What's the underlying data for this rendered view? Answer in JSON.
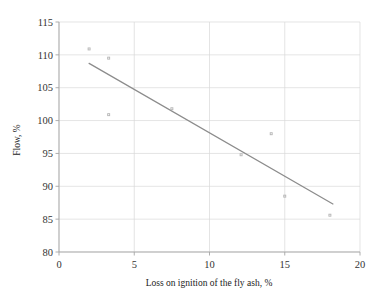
{
  "chart_data": {
    "type": "scatter",
    "title": "",
    "xlabel": "Loss on ignition of the fly ash, %",
    "ylabel": "Flow, %",
    "xlim": [
      0,
      20
    ],
    "ylim": [
      80,
      115
    ],
    "xticks": [
      0,
      5,
      10,
      15,
      20
    ],
    "yticks": [
      80,
      85,
      90,
      95,
      100,
      105,
      110,
      115
    ],
    "xtick_labels": [
      "0",
      "5",
      "10",
      "15",
      "20"
    ],
    "ytick_labels": [
      "80",
      "85",
      "90",
      "95",
      "100",
      "105",
      "110",
      "115"
    ],
    "grid": true,
    "legend": null,
    "series": [
      {
        "name": "Flow measurements",
        "type": "scatter",
        "marker": "small-square",
        "color": "#b5b5b5",
        "points": [
          {
            "x": 2.0,
            "y": 110.9
          },
          {
            "x": 3.3,
            "y": 109.5
          },
          {
            "x": 3.3,
            "y": 100.9
          },
          {
            "x": 7.5,
            "y": 101.8
          },
          {
            "x": 12.1,
            "y": 94.8
          },
          {
            "x": 14.1,
            "y": 98.0
          },
          {
            "x": 15.0,
            "y": 88.5
          },
          {
            "x": 18.0,
            "y": 85.6
          }
        ]
      },
      {
        "name": "Linear trend line",
        "type": "line",
        "color": "#8c8c8c",
        "points": [
          {
            "x": 2.0,
            "y": 108.7
          },
          {
            "x": 18.2,
            "y": 87.3
          }
        ]
      }
    ]
  },
  "axes": {
    "x_title": "Loss on ignition of the fly ash, %",
    "y_title": "Flow, %"
  }
}
